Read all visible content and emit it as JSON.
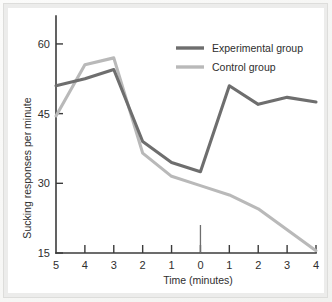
{
  "figure": {
    "background_color": "#f4f4f2",
    "plot_background_color": "#ffffff",
    "frame_color": "#d9d9d7"
  },
  "chart_data": {
    "type": "line",
    "title": "",
    "subtitle": "",
    "xlabel": "Time (minutes)",
    "ylabel": "Sucking responses per minute",
    "grid": false,
    "legend_position": "top-right",
    "xlim": [
      0,
      9
    ],
    "ylim": [
      15,
      63
    ],
    "ytick_values": [
      15,
      30,
      45,
      60
    ],
    "ytick_labels": [
      "15",
      "30",
      "45",
      "60"
    ],
    "xtick_positions": [
      0,
      1,
      2,
      3,
      4,
      5,
      6,
      7,
      8,
      9
    ],
    "xtick_labels": [
      "5",
      "4",
      "3",
      "2",
      "1",
      "0",
      "1",
      "2",
      "3",
      "4"
    ],
    "x": [
      0,
      1,
      2,
      3,
      4,
      5,
      6,
      7,
      8,
      9
    ],
    "series": [
      {
        "name": "Experimental group",
        "color": "#6e6e6e",
        "values": [
          51.0,
          52.5,
          54.5,
          39.0,
          34.5,
          32.5,
          51.0,
          47.0,
          48.5,
          47.5
        ]
      },
      {
        "name": "Control group",
        "color": "#b9b9b9",
        "values": [
          44.5,
          55.5,
          57.0,
          36.5,
          31.5,
          29.5,
          27.5,
          24.5,
          20.0,
          15.5
        ]
      }
    ],
    "annotations": [
      {
        "name": "zero-marker",
        "x": 5,
        "description": "tick at time 0 extends upward into plot"
      }
    ]
  },
  "legend": {
    "items": [
      {
        "label": "Experimental group",
        "color": "#6e6e6e"
      },
      {
        "label": "Control group",
        "color": "#b9b9b9"
      }
    ]
  }
}
